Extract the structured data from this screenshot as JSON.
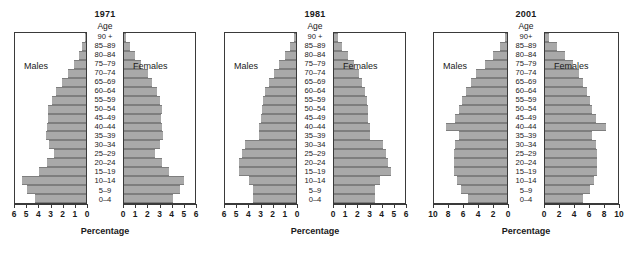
{
  "figure": {
    "axis_title": "Percentage",
    "age_header": "Age",
    "males_label": "Males",
    "females_label": "Females",
    "bar_color": "#a9a9a9",
    "bar_edge_color": "#7e7e7e",
    "box_border_color": "#3a3a3a",
    "background": "#ffffff"
  },
  "chart_data": [
    {
      "type": "bar",
      "title": "1971",
      "subtype": "population-pyramid",
      "xlabel": "Percentage",
      "ylabel": "Age",
      "xlim": [
        0,
        6
      ],
      "left_ticks": [
        6,
        5,
        4,
        3,
        2,
        1,
        0
      ],
      "right_ticks": [
        0,
        1,
        2,
        3,
        4,
        5,
        6
      ],
      "grid": false,
      "categories": [
        "90 +",
        "85–89",
        "80–84",
        "75–79",
        "70–74",
        "65–69",
        "60–64",
        "55–59",
        "50–54",
        "45–49",
        "40–44",
        "35–39",
        "30–34",
        "25–29",
        "20–24",
        "15–19",
        "10–14",
        "5–9",
        "0–4"
      ],
      "series": [
        {
          "name": "Males",
          "side": "left",
          "values": [
            0.1,
            0.3,
            0.6,
            1.0,
            1.5,
            2.0,
            2.5,
            2.9,
            3.2,
            3.2,
            3.3,
            3.4,
            3.1,
            2.7,
            3.3,
            4.0,
            5.4,
            5.0,
            4.3
          ]
        },
        {
          "name": "Females",
          "side": "right",
          "values": [
            0.2,
            0.5,
            0.9,
            1.4,
            2.0,
            2.4,
            2.8,
            3.0,
            3.2,
            3.1,
            3.2,
            3.3,
            3.0,
            2.6,
            3.2,
            3.8,
            5.1,
            4.7,
            4.1
          ]
        }
      ]
    },
    {
      "type": "bar",
      "title": "1981",
      "subtype": "population-pyramid",
      "xlabel": "Percentage",
      "ylabel": "Age",
      "xlim": [
        0,
        6
      ],
      "left_ticks": [
        6,
        5,
        4,
        3,
        2,
        1,
        0
      ],
      "right_ticks": [
        0,
        1,
        2,
        3,
        4,
        5,
        6
      ],
      "grid": false,
      "categories": [
        "90 +",
        "85–89",
        "80–84",
        "75–79",
        "70–74",
        "65–69",
        "60–64",
        "55–59",
        "50–54",
        "45–49",
        "40–44",
        "35–39",
        "30–34",
        "25–29",
        "20–24",
        "15–19",
        "10–14",
        "5–9",
        "0–4"
      ],
      "series": [
        {
          "name": "Males",
          "side": "left",
          "values": [
            0.2,
            0.5,
            0.9,
            1.4,
            1.9,
            2.3,
            2.6,
            2.8,
            2.9,
            3.0,
            3.1,
            3.1,
            4.3,
            4.6,
            4.8,
            4.8,
            4.0,
            3.6,
            3.6
          ]
        },
        {
          "name": "Females",
          "side": "right",
          "values": [
            0.3,
            0.7,
            1.2,
            1.7,
            2.1,
            2.4,
            2.6,
            2.8,
            2.9,
            2.9,
            3.0,
            3.0,
            4.1,
            4.4,
            4.6,
            4.8,
            3.9,
            3.5,
            3.5
          ]
        }
      ]
    },
    {
      "type": "bar",
      "title": "2001",
      "subtype": "population-pyramid",
      "xlabel": "Percentage",
      "ylabel": "Age",
      "xlim": [
        0,
        10
      ],
      "left_ticks": [
        10,
        8,
        6,
        4,
        2,
        0
      ],
      "right_ticks": [
        0,
        2,
        4,
        6,
        8,
        10
      ],
      "grid": false,
      "categories": [
        "90+",
        "85–89",
        "80–84",
        "75–79",
        "70–74",
        "65–69",
        "60–64",
        "55–59",
        "50–54",
        "45–49",
        "40–44",
        "35–39",
        "30–34",
        "25–29",
        "20–24",
        "15–19",
        "10–14",
        "5–9",
        "0–4"
      ],
      "series": [
        {
          "name": "Males",
          "side": "left",
          "values": [
            0.3,
            0.9,
            1.9,
            3.0,
            4.2,
            5.0,
            5.6,
            6.1,
            6.6,
            7.1,
            8.4,
            6.6,
            7.1,
            7.2,
            7.2,
            7.2,
            6.9,
            6.3,
            5.4
          ]
        },
        {
          "name": "Females",
          "side": "right",
          "values": [
            0.6,
            1.6,
            2.8,
            3.9,
            4.7,
            5.2,
            5.7,
            6.1,
            6.5,
            7.0,
            8.4,
            6.5,
            7.0,
            7.1,
            7.1,
            7.1,
            6.7,
            6.1,
            5.2
          ]
        }
      ]
    }
  ]
}
